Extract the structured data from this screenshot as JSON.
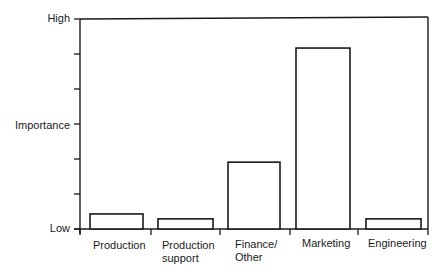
{
  "chart_data": {
    "type": "bar",
    "title": "",
    "xlabel": "",
    "ylabel": "Importance",
    "categories": [
      "Production",
      "Production support",
      "Finance/Other",
      "Marketing",
      "Engineering"
    ],
    "category_display": [
      "Production",
      "Production\nsupport",
      "Finance/\nOther",
      "Marketing",
      "Engineering"
    ],
    "values": [
      0.43,
      0.29,
      1.91,
      5.17,
      0.29
    ],
    "ylim": [
      0,
      6
    ],
    "yticks": [
      0,
      1,
      2,
      3,
      4,
      5,
      6
    ],
    "ytick_labels": {
      "0": "Low",
      "3": "Importance",
      "6": "High"
    },
    "grid": false,
    "legend": null,
    "bar_style": {
      "fill": "#ffffff",
      "stroke": "#1a1a1a"
    }
  },
  "axis": {
    "high_label": "High",
    "mid_label": "Importance",
    "low_label": "Low"
  },
  "labels": {
    "c0": "Production",
    "c1": "Production\nsupport",
    "c2": "Finance/\nOther",
    "c3": "Marketing",
    "c4": "Engineering"
  }
}
